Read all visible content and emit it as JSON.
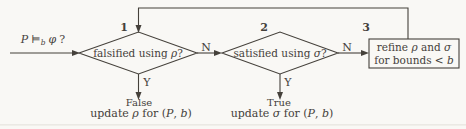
{
  "colors": {
    "background": "#f9f8f5",
    "ink": "#45413b"
  },
  "start": {
    "p": "P",
    "relation": "⊨",
    "bound_sub": "b",
    "phi": "φ",
    "question": "?"
  },
  "step1": {
    "badge": "1",
    "label_prefix": "falsified using ",
    "label_sym": "ρ",
    "label_suffix": "?",
    "no_label": "N",
    "yes_label": "Y"
  },
  "step2": {
    "badge": "2",
    "label_prefix": "satisfied using ",
    "label_sym": "σ",
    "label_suffix": "?",
    "no_label": "N",
    "yes_label": "Y"
  },
  "step3": {
    "badge": "3",
    "line1_prefix": "refine ",
    "line1_rho": "ρ",
    "line1_mid": " and ",
    "line1_sigma": "σ",
    "line2_prefix": "for bounds < ",
    "line2_b": "b"
  },
  "outcome_false": {
    "title": "False",
    "prefix": "update ",
    "sym": "ρ",
    "mid": " for (",
    "p": "P",
    "comma": ", ",
    "b": "b",
    "close": ")"
  },
  "outcome_true": {
    "title": "True",
    "prefix": "update ",
    "sym": "σ",
    "mid": " for (",
    "p": "P",
    "comma": ", ",
    "b": "b",
    "close": ")"
  }
}
